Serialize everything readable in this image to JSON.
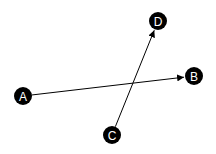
{
  "diagram": {
    "type": "directed-graph",
    "node_color": "#000000",
    "label_color": "#ffffff",
    "edge_color": "#000000",
    "nodes": [
      {
        "id": "A",
        "label": "A",
        "x": 23,
        "y": 96
      },
      {
        "id": "B",
        "label": "B",
        "x": 194,
        "y": 76
      },
      {
        "id": "C",
        "label": "C",
        "x": 112,
        "y": 135
      },
      {
        "id": "D",
        "label": "D",
        "x": 158,
        "y": 21
      }
    ],
    "edges": [
      {
        "from": "A",
        "to": "B"
      },
      {
        "from": "C",
        "to": "D"
      }
    ]
  }
}
